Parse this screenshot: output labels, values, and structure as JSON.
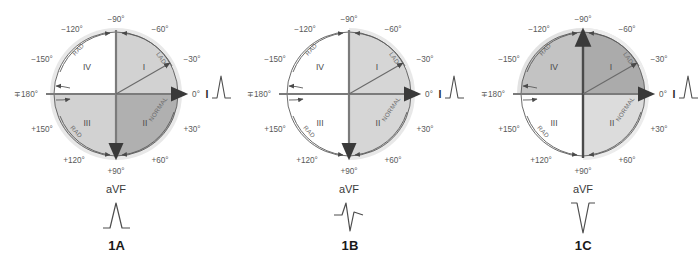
{
  "figure": {
    "type": "hexaxial-reference-circles",
    "panel_count": 3
  },
  "common": {
    "degree_labels": {
      "minus_90": "−90°",
      "minus_120": "−120°",
      "minus_150": "−150°",
      "plus_minus_180": "∓180°",
      "plus_150": "+150°",
      "plus_120": "+120°",
      "plus_90": "+90°",
      "plus_60": "+60°",
      "plus_30": "+30°",
      "zero": "0°",
      "minus_30": "−30°",
      "minus_60": "−60°"
    },
    "quadrants": {
      "q1": "I",
      "q2": "II",
      "q3": "III",
      "q4": "IV"
    },
    "arc_labels": {
      "upper_right": "LAD",
      "upper_left": "RAD",
      "lower_left": "RAD",
      "lower_right": "NORMAL"
    },
    "lead_one_label": "I",
    "avf_label": "aVF",
    "colors": {
      "shade_dark": "#a8a8a8",
      "shade_mid": "#c4c4c4",
      "shade_light": "#dcdcdc",
      "halo": "#e4e4e4",
      "circle_stroke": "#555555",
      "axis_stroke": "#6e6e6e",
      "text": "#5a5a5a",
      "caption_text": "#1a1a1a",
      "ecg_stroke": "#4d4d4d"
    }
  },
  "panels": [
    {
      "caption": "1A",
      "avf_waveform": "positive",
      "lead_one_waveform": "positive",
      "vertical_axis_arrow": "down",
      "shading": {
        "q1": "light",
        "q2": "dark",
        "q3": "light",
        "q4": "none"
      }
    },
    {
      "caption": "1B",
      "avf_waveform": "biphasic",
      "lead_one_waveform": "positive",
      "vertical_axis_arrow": "down",
      "shading": {
        "q1": "light",
        "q2": "light",
        "q3": "none",
        "q4": "none"
      }
    },
    {
      "caption": "1C",
      "avf_waveform": "negative",
      "lead_one_waveform": "positive",
      "vertical_axis_arrow": "up",
      "shading": {
        "q1": "dark",
        "q2": "light",
        "q3": "none",
        "q4": "mid"
      }
    }
  ]
}
